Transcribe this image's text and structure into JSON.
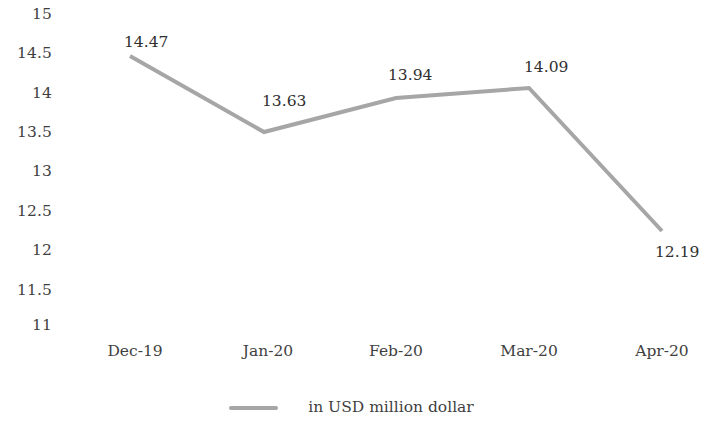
{
  "chart_data": {
    "type": "line",
    "title": "",
    "subtitle": "",
    "xlabel": "",
    "ylabel": "",
    "categories": [
      "Dec-19",
      "Jan-20",
      "Feb-20",
      "Mar-20",
      "Apr-20"
    ],
    "series": [
      {
        "name": "in USD million dollar",
        "values": [
          14.47,
          13.63,
          13.94,
          14.09,
          12.19
        ],
        "color": "#a6a6a6"
      }
    ],
    "point_labels": [
      "14.47",
      "13.63",
      "13.94",
      "14.09",
      "12.19"
    ],
    "ylim": [
      11,
      15
    ],
    "y_ticks": [
      "15",
      "14.5",
      "14",
      "13.5",
      "13",
      "12.5",
      "12",
      "11.5",
      "11"
    ],
    "y_tick_values": [
      15,
      14.5,
      14,
      13.5,
      13,
      12.5,
      12,
      11.5,
      11
    ],
    "grid": false,
    "legend": {
      "position": "bottom",
      "entries": [
        {
          "label": "in USD million dollar",
          "color": "#a6a6a6"
        }
      ]
    },
    "axis_line_color": "#ffffff",
    "text_color": "#3f3f3f"
  },
  "y_axis": {
    "ticks": [
      {
        "label": "15",
        "top": 7
      },
      {
        "label": "14.5",
        "top": 46
      },
      {
        "label": "14",
        "top": 86
      },
      {
        "label": "13.5",
        "top": 125
      },
      {
        "label": "13",
        "top": 164
      },
      {
        "label": "12.5",
        "top": 204
      },
      {
        "label": "12",
        "top": 243
      },
      {
        "label": "11.5",
        "top": 283
      },
      {
        "label": "11",
        "top": 318
      }
    ]
  },
  "x_axis": {
    "ticks": [
      {
        "label": "Dec-19",
        "left": 135
      },
      {
        "label": "Jan-20",
        "left": 268
      },
      {
        "label": "Feb-20",
        "left": 396
      },
      {
        "label": "Mar-20",
        "left": 529
      },
      {
        "label": "Apr-20",
        "left": 662
      }
    ]
  },
  "line": {
    "color": "#a6a6a6",
    "width": 4,
    "points": "130,56 264,132 396,98 529,88 662,231"
  },
  "data_labels": [
    {
      "text": "14.47",
      "left": 124,
      "top": 35
    },
    {
      "text": "13.63",
      "left": 262,
      "top": 94
    },
    {
      "text": "13.94",
      "left": 388,
      "top": 68
    },
    {
      "text": "14.09",
      "left": 524,
      "top": 60
    },
    {
      "text": "12.19",
      "left": 655,
      "top": 245
    }
  ],
  "legend": {
    "marker_color": "#a6a6a6",
    "label": "in USD million dollar"
  }
}
